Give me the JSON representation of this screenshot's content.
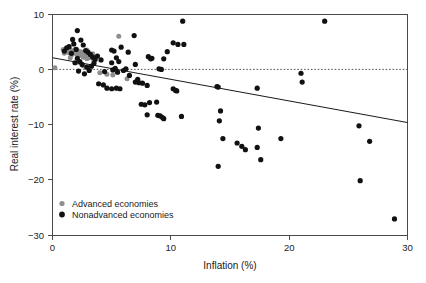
{
  "chart_data": {
    "type": "scatter",
    "title": "",
    "xlabel": "Inflation (%)",
    "ylabel": "Real interest rate (%)",
    "xlim": [
      0,
      30
    ],
    "ylim": [
      -30,
      10
    ],
    "xticks": [
      0,
      10,
      20,
      30
    ],
    "yticks": [
      10,
      0,
      -10,
      -20,
      -30
    ],
    "xticklabels": [
      "0",
      "10",
      "20",
      "30"
    ],
    "yticklabels": [
      "10",
      "0",
      "−10",
      "−20",
      "−30"
    ],
    "grid": false,
    "legend_position": "lower-left-inside",
    "legend": [
      {
        "name": "Advanced economies",
        "color": "#8e8e8e",
        "marker": "circle"
      },
      {
        "name": "Nonadvanced economies",
        "color": "#111111",
        "marker": "circle"
      }
    ],
    "reference_lines": [
      {
        "name": "zero-line",
        "type": "horizontal-dashed",
        "y": 0,
        "color": "#555555"
      }
    ],
    "trend_line": {
      "name": "fitted-regression-line",
      "type": "linear",
      "color": "#1a1a1a",
      "x_start": 0,
      "y_start": 2.1,
      "x_end": 30,
      "y_end": -9.6
    },
    "series": [
      {
        "name": "Advanced economies",
        "color": "#8e8e8e",
        "points": [
          [
            0.2,
            0.3
          ],
          [
            0.9,
            3.6
          ],
          [
            1.0,
            2.9
          ],
          [
            1.1,
            3.4
          ],
          [
            1.2,
            3.2
          ],
          [
            1.3,
            3.8
          ],
          [
            1.4,
            3.0
          ],
          [
            1.5,
            3.5
          ],
          [
            1.6,
            2.6
          ],
          [
            1.7,
            3.3
          ],
          [
            1.8,
            3.1
          ],
          [
            1.9,
            3.6
          ],
          [
            2.0,
            2.8
          ],
          [
            2.1,
            3.4
          ],
          [
            2.2,
            3.0
          ],
          [
            2.3,
            2.5
          ],
          [
            2.4,
            3.2
          ],
          [
            2.5,
            2.9
          ],
          [
            2.6,
            2.2
          ],
          [
            2.7,
            2.7
          ],
          [
            2.8,
            2.4
          ],
          [
            2.9,
            1.9
          ],
          [
            3.0,
            2.6
          ],
          [
            3.1,
            2.1
          ],
          [
            3.2,
            2.3
          ],
          [
            3.4,
            2.8
          ],
          [
            3.5,
            1.6
          ],
          [
            3.6,
            2.0
          ],
          [
            2.6,
            0.6
          ],
          [
            3.2,
            0.2
          ],
          [
            4.0,
            -0.6
          ],
          [
            4.6,
            -0.9
          ],
          [
            5.1,
            -1.0
          ],
          [
            5.6,
            6.0
          ],
          [
            6.3,
            -1.7
          ],
          [
            2.2,
            1.3
          ],
          [
            1.5,
            2.1
          ],
          [
            2.9,
            3.5
          ]
        ]
      },
      {
        "name": "Nonadvanced economies",
        "color": "#111111",
        "points": [
          [
            1.7,
            5.4
          ],
          [
            2.1,
            7.0
          ],
          [
            1.8,
            4.6
          ],
          [
            1.4,
            4.1
          ],
          [
            1.2,
            3.9
          ],
          [
            2.4,
            5.3
          ],
          [
            2.6,
            4.4
          ],
          [
            2.0,
            3.6
          ],
          [
            1.0,
            3.3
          ],
          [
            1.6,
            2.9
          ],
          [
            2.8,
            3.4
          ],
          [
            3.0,
            3.1
          ],
          [
            3.2,
            2.7
          ],
          [
            3.4,
            2.2
          ],
          [
            3.6,
            1.8
          ],
          [
            2.3,
            1.4
          ],
          [
            2.5,
            0.9
          ],
          [
            2.9,
            0.4
          ],
          [
            3.1,
            -0.2
          ],
          [
            3.3,
            0.6
          ],
          [
            3.5,
            1.1
          ],
          [
            2.2,
            -0.3
          ],
          [
            2.7,
            -0.8
          ],
          [
            1.9,
            1.2
          ],
          [
            2.1,
            2.0
          ],
          [
            3.8,
            2.4
          ],
          [
            4.1,
            1.7
          ],
          [
            4.4,
            -0.4
          ],
          [
            3.9,
            -2.6
          ],
          [
            4.3,
            -2.8
          ],
          [
            5.0,
            3.5
          ],
          [
            5.2,
            3.3
          ],
          [
            5.4,
            2.1
          ],
          [
            5.0,
            1.2
          ],
          [
            5.3,
            0.2
          ],
          [
            5.1,
            -0.1
          ],
          [
            5.5,
            -0.5
          ],
          [
            5.8,
            4.0
          ],
          [
            5.6,
            1.4
          ],
          [
            6.0,
            -0.2
          ],
          [
            6.2,
            0.1
          ],
          [
            4.6,
            -3.4
          ],
          [
            5.0,
            -3.5
          ],
          [
            5.4,
            -3.4
          ],
          [
            5.7,
            -3.5
          ],
          [
            6.5,
            -1.1
          ],
          [
            6.9,
            6.1
          ],
          [
            6.4,
            3.1
          ],
          [
            7.0,
            0.9
          ],
          [
            7.2,
            -1.8
          ],
          [
            7.3,
            -2.4
          ],
          [
            7.0,
            -2.3
          ],
          [
            7.6,
            -2.5
          ],
          [
            7.5,
            -6.3
          ],
          [
            7.8,
            -6.4
          ],
          [
            8.0,
            -2.9
          ],
          [
            8.1,
            2.3
          ],
          [
            8.4,
            2.0
          ],
          [
            8.3,
            1.9
          ],
          [
            8.8,
            -5.9
          ],
          [
            8.2,
            -6.0
          ],
          [
            8.0,
            -8.2
          ],
          [
            8.9,
            -8.3
          ],
          [
            9.1,
            -8.4
          ],
          [
            9.3,
            -8.7
          ],
          [
            9.4,
            -8.9
          ],
          [
            9.0,
            0.1
          ],
          [
            9.2,
            0.0
          ],
          [
            9.4,
            1.9
          ],
          [
            9.7,
            3.2
          ],
          [
            10.2,
            -3.5
          ],
          [
            10.4,
            -3.8
          ],
          [
            10.2,
            4.8
          ],
          [
            10.6,
            4.5
          ],
          [
            10.5,
            -3.9
          ],
          [
            11.0,
            8.7
          ],
          [
            11.1,
            4.5
          ],
          [
            10.9,
            -8.5
          ],
          [
            13.9,
            -3.1
          ],
          [
            14.0,
            -3.2
          ],
          [
            14.2,
            -7.5
          ],
          [
            14.1,
            -9.3
          ],
          [
            14.4,
            -12.5
          ],
          [
            14.0,
            -17.5
          ],
          [
            15.6,
            -13.3
          ],
          [
            16.3,
            -14.5
          ],
          [
            16.0,
            -13.9
          ],
          [
            17.3,
            -14.1
          ],
          [
            17.3,
            -3.4
          ],
          [
            17.4,
            -10.6
          ],
          [
            17.6,
            -16.3
          ],
          [
            19.3,
            -12.5
          ],
          [
            21.0,
            -0.7
          ],
          [
            21.1,
            -2.3
          ],
          [
            23.0,
            8.7
          ],
          [
            25.9,
            -10.2
          ],
          [
            26.8,
            -13.0
          ],
          [
            26.0,
            -20.1
          ],
          [
            28.9,
            -27.0
          ]
        ]
      }
    ]
  }
}
